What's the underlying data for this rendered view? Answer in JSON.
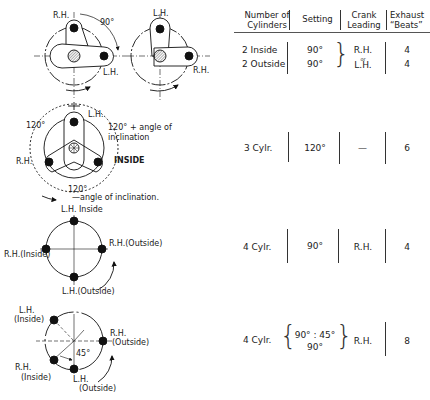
{
  "table": {
    "headers": [
      {
        "line1": "Number of",
        "line2": "Cylinders"
      },
      {
        "line1": "Setting",
        "line2": ""
      },
      {
        "line1": "Crank",
        "line2": "Leading"
      },
      {
        "line1": "Exhaust",
        "line2": "“Beats”"
      }
    ],
    "rows": [
      {
        "cylinders": [
          "2 Inside",
          "2 Outside"
        ],
        "setting": [
          "90°",
          "90°"
        ],
        "crank": [
          "R.H.",
          "or",
          "L.H."
        ],
        "beats": [
          "4",
          "4"
        ]
      },
      {
        "cylinders": "3 Cylr.",
        "setting": "120°",
        "crank": "—",
        "beats": "6"
      },
      {
        "cylinders": "4 Cylr.",
        "setting": "90°",
        "crank": "R.H.",
        "beats": "4"
      },
      {
        "cylinders": "4 Cylr.",
        "setting": [
          "90° : 45°",
          "90°"
        ],
        "crank": "R.H.",
        "beats": "8"
      }
    ]
  },
  "diagrams": {
    "d1": {
      "rh": "R.H.",
      "lh": "L.H.",
      "angle": "90°",
      "lh2": "L.H.",
      "rh2": "R.H."
    },
    "d2": {
      "lh": "L.H.",
      "rh": "R.H.",
      "inside": "INSIDE",
      "angle_left": "120°",
      "angle_right": "120°",
      "plus": "+ angle of",
      "inclination": "inclination",
      "angle_bottom": "120°",
      "minus": "—angle  of  inclination."
    },
    "d3": {
      "top": "L.H. Inside",
      "right": "R.H.(Outside)",
      "left": "R.H.(Inside)",
      "bottom": "L.H.(Outside)"
    },
    "d4": {
      "lh_top": "L.H.",
      "lh_top_sub": "(Inside)",
      "rh_right": "R.H.",
      "rh_right_sub": "(Outside)",
      "rh_left": "R.H.",
      "rh_left_sub": "(Inside)",
      "lh_bottom": "L.H.",
      "lh_bottom_sub": "(Outside)",
      "angle": "45°"
    }
  }
}
